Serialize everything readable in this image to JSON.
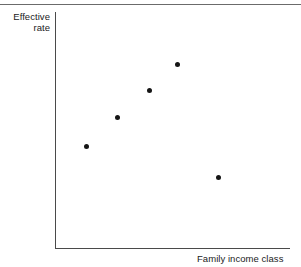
{
  "figure": {
    "width": 301,
    "height": 267,
    "background": "#ffffff",
    "rule_color": "#6b6b6b",
    "axis_color": "#4a4a4a",
    "marker_color": "#151515",
    "cut_off_text": ""
  },
  "axes": {
    "y_label_line1": "Effective",
    "y_label_line2": "rate",
    "x_label": "Family income class"
  },
  "chart_data": {
    "type": "scatter",
    "title": "",
    "xlabel": "Family income class",
    "ylabel": "Effective rate",
    "grid": false,
    "legend": null,
    "xlim": [
      0,
      1
    ],
    "ylim": [
      0,
      1
    ],
    "axis_ticks": {
      "x": [],
      "y": []
    },
    "series": [
      {
        "name": "Effective rate",
        "marker": "filled-circle",
        "color": "#151515",
        "points": [
          {
            "px": 86,
            "py": 146,
            "x": 0.132,
            "y": 0.432
          },
          {
            "px": 117,
            "py": 117,
            "x": 0.264,
            "y": 0.555
          },
          {
            "px": 149,
            "py": 90,
            "x": 0.4,
            "y": 0.669
          },
          {
            "px": 177,
            "py": 64,
            "x": 0.519,
            "y": 0.78
          },
          {
            "px": 218,
            "py": 177,
            "x": 0.694,
            "y": 0.301
          }
        ]
      }
    ],
    "annotations": []
  }
}
